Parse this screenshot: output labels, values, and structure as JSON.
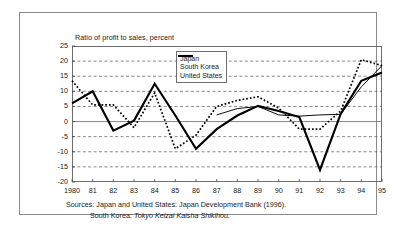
{
  "chart_data": {
    "type": "line",
    "title": "Ratio of profit to sales, percent",
    "xlabel": "",
    "ylabel": "",
    "ylim": [
      -20,
      25
    ],
    "yticks": [
      25,
      20,
      15,
      10,
      5,
      0,
      -5,
      -10,
      -15,
      -20
    ],
    "ytick_labels": [
      "25",
      "20",
      "15",
      "10",
      "5",
      "0",
      "-5",
      "-10",
      "-15",
      "-20"
    ],
    "grid": "horizontal-dashed",
    "legend_position": "top-center",
    "x": [
      1980,
      1981,
      1982,
      1983,
      1984,
      1985,
      1986,
      1987,
      1988,
      1989,
      1990,
      1991,
      1992,
      1993,
      1994,
      1995
    ],
    "xtick_labels": [
      "1980",
      "81",
      "82",
      "83",
      "84",
      "85",
      "86",
      "87",
      "88",
      "89",
      "90",
      "91",
      "92",
      "93",
      "94",
      "95"
    ],
    "series": [
      {
        "name": "Japan",
        "style": "solid-thick",
        "color": "#000000",
        "values": [
          6.0,
          10.0,
          -3.0,
          0.3,
          12.5,
          2.0,
          -9.0,
          -2.5,
          2.0,
          5.2,
          3.5,
          1.5,
          -16.0,
          2.5,
          13.5,
          16.2
        ]
      },
      {
        "name": "South Korea",
        "style": "solid-thin",
        "color": "#000000",
        "values": [
          null,
          null,
          null,
          null,
          null,
          null,
          null,
          2.2,
          4.3,
          5.0,
          2.2,
          1.8,
          2.2,
          2.4,
          11.5,
          18.5
        ]
      },
      {
        "name": "United States",
        "style": "dotted",
        "color": "#000000",
        "values": [
          13.5,
          5.5,
          5.5,
          -2.0,
          9.5,
          -9.0,
          -4.5,
          5.0,
          7.0,
          8.2,
          4.5,
          -2.5,
          -2.5,
          3.5,
          20.5,
          18.5
        ]
      }
    ]
  },
  "legend": {
    "items": [
      {
        "label": "Japan",
        "key": "solid-thick"
      },
      {
        "label": "South Korea",
        "key": "solid-thin"
      },
      {
        "label": "United States",
        "key": "dotted"
      }
    ]
  },
  "sources": {
    "line1": "Sources: Japan and United States: Japan Development Bank (1996).",
    "line2_prefix": "South Korea: ",
    "line2_italic": "Tokyo Keizai Kaisha Shikihou."
  }
}
